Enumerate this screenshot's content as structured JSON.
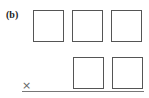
{
  "figure": {
    "label": "(b)",
    "operator_symbol": "×",
    "operator_icon": "multiply-icon",
    "top_row": {
      "box_count": 3,
      "boxes": [
        "",
        "",
        ""
      ]
    },
    "bottom_row": {
      "box_count": 2,
      "boxes": [
        "",
        ""
      ]
    },
    "colors": {
      "box_border": "#555555",
      "line": "#777777",
      "symbol": "#666666"
    }
  }
}
